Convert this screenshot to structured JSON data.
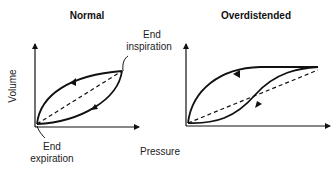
{
  "panels": [
    {
      "title": "Normal",
      "annotations": {
        "top_right": [
          "End",
          "inspiration"
        ],
        "origin": [
          "End",
          "expiration"
        ]
      }
    },
    {
      "title": "Overdistended"
    }
  ],
  "axes": {
    "y_label": "Volume",
    "x_label": "Pressure"
  },
  "colors": {
    "line": "#111111",
    "background": "#ffffff"
  }
}
